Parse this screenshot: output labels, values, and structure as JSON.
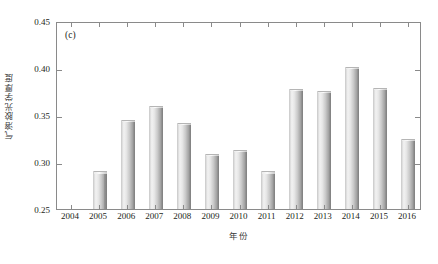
{
  "chart_data": {
    "type": "bar",
    "title": "",
    "panel_label": "(c)",
    "xlabel": "年份",
    "ylabel": "气溶胶光学厚度",
    "categories": [
      "2004",
      "2005",
      "2006",
      "2007",
      "2008",
      "2009",
      "2010",
      "2011",
      "2012",
      "2013",
      "2014",
      "2015",
      "2016"
    ],
    "values": [
      null,
      0.29,
      0.345,
      0.36,
      0.342,
      0.309,
      0.313,
      0.29,
      0.378,
      0.376,
      0.401,
      0.379,
      0.325
    ],
    "ylim": [
      0.25,
      0.45
    ],
    "yticks": [
      0.25,
      0.3,
      0.35,
      0.4,
      0.45
    ],
    "ytick_labels": [
      "0.25",
      "0.30",
      "0.35",
      "0.40",
      "0.45"
    ],
    "grid": false,
    "legend": null,
    "series": [
      {
        "name": "气溶胶光学厚度",
        "values": [
          null,
          0.29,
          0.345,
          0.36,
          0.342,
          0.309,
          0.313,
          0.29,
          0.378,
          0.376,
          0.401,
          0.379,
          0.325
        ]
      }
    ],
    "bar_color": "#c9c9c9",
    "axis_color": "#8a8a8a",
    "text_color": "#231f20"
  }
}
